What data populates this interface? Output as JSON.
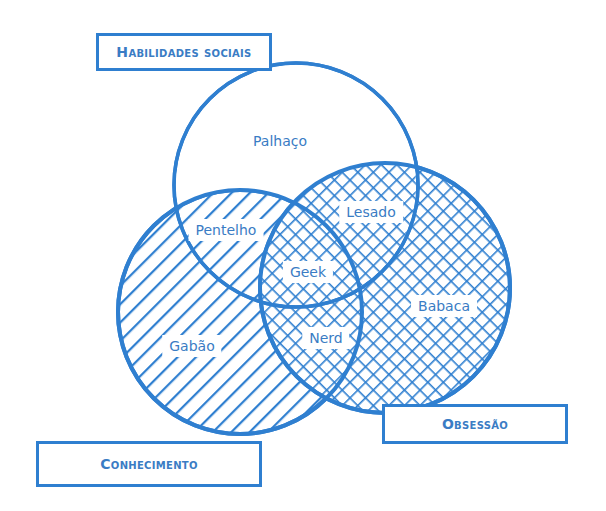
{
  "diagram": {
    "type": "venn",
    "colors": {
      "stroke": "#2f7fd0",
      "text": "#3a7cc4",
      "background": "#ffffff"
    },
    "categories": [
      {
        "id": "social",
        "label": "Habilidades sociais",
        "fill": "none"
      },
      {
        "id": "knowledge",
        "label": "Conhecimento",
        "fill": "diagonal-hatch"
      },
      {
        "id": "obsession",
        "label": "Obsessão",
        "fill": "crosshatch"
      }
    ],
    "regions": [
      {
        "label": "Palhaço",
        "sets": [
          "social"
        ]
      },
      {
        "label": "Pentelho",
        "sets": [
          "social",
          "knowledge"
        ]
      },
      {
        "label": "Lesado",
        "sets": [
          "social",
          "obsession"
        ]
      },
      {
        "label": "Geek",
        "sets": [
          "social",
          "knowledge",
          "obsession"
        ]
      },
      {
        "label": "Gabão",
        "sets": [
          "knowledge"
        ]
      },
      {
        "label": "Nerd",
        "sets": [
          "knowledge",
          "obsession"
        ]
      },
      {
        "label": "Babaca",
        "sets": [
          "obsession"
        ]
      }
    ]
  },
  "labels": {
    "social": "Habilidades sociais",
    "knowledge": "Conhecimento",
    "obsession": "Obsessão",
    "palhaco": "Palhaço",
    "pentelho": "Pentelho",
    "lesado": "Lesado",
    "geek": "Geek",
    "gabao": "Gabão",
    "nerd": "Nerd",
    "babaca": "Babaca"
  }
}
